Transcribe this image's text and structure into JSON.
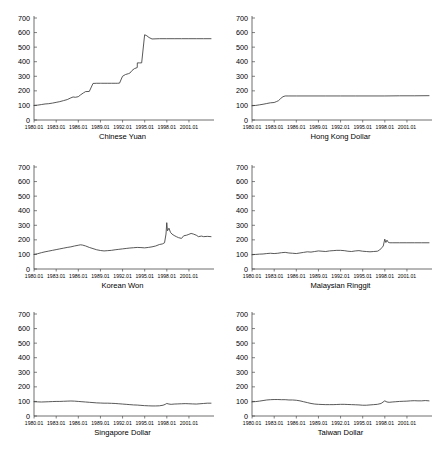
{
  "figure": {
    "panel_order": [
      "chinese_yuan",
      "hong_kong_dollar",
      "korean_won",
      "malaysian_ringgit",
      "singapore_dollar",
      "taiwan_dollar"
    ],
    "axis_color": "#4a4a4a",
    "series_color": "#3b3b3b",
    "background": "#ffffff"
  },
  "chart_data": [
    {
      "type": "line",
      "title": "Chinese Yuan",
      "xlabel": "",
      "ylabel": "",
      "ylim": [
        0,
        700
      ],
      "yticks": [
        0,
        100,
        200,
        300,
        400,
        500,
        600,
        700
      ],
      "ytick_labels": [
        "0",
        "100",
        "200",
        "300",
        "400",
        "500",
        "600",
        "700"
      ],
      "xlim": [
        1980.0,
        2004.0
      ],
      "xticks": [
        1980.01,
        1983.01,
        1986.01,
        1989.01,
        1992.01,
        1995.01,
        1998.01,
        2001.01
      ],
      "xtick_labels": [
        "1980.01",
        "1983.01",
        "1986.01",
        "1989.01",
        "1992.01",
        "1995.01",
        "1998.01",
        "2001.01"
      ],
      "grid": false,
      "legend": "none",
      "x": [
        1980.0,
        1980.5,
        1981.0,
        1981.5,
        1982.0,
        1982.5,
        1983.0,
        1983.5,
        1984.0,
        1984.5,
        1985.0,
        1985.3,
        1985.6,
        1986.0,
        1986.3,
        1986.7,
        1987.0,
        1987.5,
        1988.0,
        1988.5,
        1989.0,
        1989.2,
        1989.5,
        1990.0,
        1990.5,
        1991.0,
        1991.3,
        1991.6,
        1992.0,
        1992.4,
        1992.8,
        1993.0,
        1993.3,
        1993.6,
        1994.0,
        1994.01,
        1994.3,
        1994.6,
        1995.0,
        1995.3,
        1995.6,
        1996.0,
        1997.0,
        1998.0,
        1999.0,
        2000.0,
        2001.0,
        2002.0,
        2003.0,
        2004.0
      ],
      "y": [
        100,
        102,
        106,
        110,
        112,
        116,
        121,
        126,
        133,
        140,
        152,
        158,
        156,
        160,
        172,
        186,
        195,
        196,
        251,
        252,
        252,
        252,
        252,
        252,
        252,
        252,
        252,
        253,
        300,
        312,
        318,
        322,
        340,
        352,
        360,
        392,
        392,
        392,
        585,
        578,
        566,
        556,
        558,
        558,
        558,
        558,
        558,
        558,
        558,
        558
      ]
    },
    {
      "type": "line",
      "title": "Hong Kong Dollar",
      "xlabel": "",
      "ylabel": "",
      "ylim": [
        0,
        700
      ],
      "yticks": [
        0,
        100,
        200,
        300,
        400,
        500,
        600,
        700
      ],
      "ytick_labels": [
        "0",
        "100",
        "200",
        "300",
        "400",
        "500",
        "600",
        "700"
      ],
      "xlim": [
        1980.0,
        2004.0
      ],
      "xticks": [
        1980.01,
        1983.01,
        1986.01,
        1989.01,
        1992.01,
        1995.01,
        1998.01,
        2001.01
      ],
      "xtick_labels": [
        "1980.01",
        "1983.01",
        "1986.01",
        "1989.01",
        "1992.01",
        "1995.01",
        "1998.01",
        "2001.01"
      ],
      "grid": false,
      "legend": "none",
      "x": [
        1980.0,
        1980.5,
        1981.0,
        1981.5,
        1982.0,
        1982.5,
        1983.0,
        1983.3,
        1983.6,
        1983.9,
        1984.2,
        1984.5,
        1985.0,
        1986.0,
        1988.0,
        1990.0,
        1992.0,
        1994.0,
        1996.0,
        1998.0,
        2000.0,
        2002.0,
        2004.0
      ],
      "y": [
        98,
        100,
        104,
        108,
        113,
        118,
        120,
        126,
        133,
        148,
        160,
        165,
        165,
        165,
        165,
        165,
        165,
        165,
        165,
        165,
        166,
        166,
        167
      ]
    },
    {
      "type": "line",
      "title": "Korean Won",
      "xlabel": "",
      "ylabel": "",
      "ylim": [
        0,
        700
      ],
      "yticks": [
        0,
        100,
        200,
        300,
        400,
        500,
        600,
        700
      ],
      "ytick_labels": [
        "0",
        "100",
        "200",
        "300",
        "400",
        "500",
        "600",
        "700"
      ],
      "xlim": [
        1980.0,
        2004.0
      ],
      "xticks": [
        1980.01,
        1983.01,
        1986.01,
        1989.01,
        1992.01,
        1995.01,
        1998.01,
        2001.01
      ],
      "xtick_labels": [
        "1980.01",
        "1983.01",
        "1986.01",
        "1989.01",
        "1992.01",
        "1995.01",
        "1998.01",
        "2001.01"
      ],
      "grid": false,
      "legend": "none",
      "x": [
        1980.0,
        1980.5,
        1981.0,
        1981.5,
        1982.0,
        1982.5,
        1983.0,
        1983.5,
        1984.0,
        1984.5,
        1985.0,
        1985.5,
        1986.0,
        1986.3,
        1986.6,
        1987.0,
        1987.5,
        1988.0,
        1988.5,
        1989.0,
        1989.5,
        1990.0,
        1990.5,
        1991.0,
        1991.5,
        1992.0,
        1992.5,
        1993.0,
        1993.5,
        1994.0,
        1994.5,
        1995.0,
        1995.5,
        1996.0,
        1996.5,
        1997.0,
        1997.4,
        1997.7,
        1997.9,
        1998.0,
        1998.1,
        1998.3,
        1998.5,
        1998.7,
        1999.0,
        1999.3,
        1999.6,
        2000.0,
        2000.3,
        2000.7,
        2001.0,
        2001.3,
        2001.6,
        2002.0,
        2002.3,
        2002.7,
        2003.0,
        2003.5,
        2004.0
      ],
      "y": [
        100,
        105,
        112,
        118,
        123,
        128,
        133,
        138,
        143,
        148,
        152,
        158,
        163,
        166,
        164,
        158,
        148,
        140,
        132,
        127,
        124,
        126,
        128,
        132,
        135,
        138,
        141,
        144,
        146,
        148,
        147,
        145,
        148,
        152,
        158,
        168,
        172,
        180,
        240,
        318,
        262,
        280,
        252,
        240,
        230,
        222,
        215,
        210,
        228,
        232,
        238,
        244,
        240,
        232,
        222,
        226,
        222,
        224,
        222
      ]
    },
    {
      "type": "line",
      "title": "Malaysian Ringgit",
      "xlabel": "",
      "ylabel": "",
      "ylim": [
        0,
        700
      ],
      "yticks": [
        0,
        100,
        200,
        300,
        400,
        500,
        600,
        700
      ],
      "ytick_labels": [
        "0",
        "100",
        "200",
        "300",
        "400",
        "500",
        "600",
        "700"
      ],
      "xlim": [
        1980.0,
        2004.0
      ],
      "xticks": [
        1980.01,
        1983.01,
        1986.01,
        1989.01,
        1992.01,
        1995.01,
        1998.01,
        2001.01
      ],
      "xtick_labels": [
        "1980.01",
        "1983.01",
        "1986.01",
        "1989.01",
        "1992.01",
        "1995.01",
        "1998.01",
        "2001.01"
      ],
      "grid": false,
      "legend": "none",
      "x": [
        1980.0,
        1980.5,
        1981.0,
        1981.5,
        1982.0,
        1982.5,
        1983.0,
        1983.5,
        1984.0,
        1984.5,
        1985.0,
        1985.5,
        1986.0,
        1986.5,
        1987.0,
        1987.5,
        1988.0,
        1988.5,
        1989.0,
        1989.5,
        1990.0,
        1990.5,
        1991.0,
        1991.5,
        1992.0,
        1992.5,
        1993.0,
        1993.5,
        1994.0,
        1994.5,
        1995.0,
        1995.5,
        1996.0,
        1996.5,
        1997.0,
        1997.3,
        1997.6,
        1997.8,
        1998.0,
        1998.15,
        1998.3,
        1998.5,
        1998.7,
        1999.0,
        2000.0,
        2001.0,
        2002.0,
        2003.0,
        2004.0
      ],
      "y": [
        98,
        100,
        102,
        103,
        106,
        108,
        106,
        108,
        112,
        114,
        110,
        108,
        106,
        110,
        114,
        118,
        116,
        120,
        124,
        122,
        120,
        124,
        126,
        128,
        128,
        126,
        122,
        120,
        124,
        126,
        122,
        120,
        118,
        120,
        122,
        130,
        146,
        158,
        205,
        182,
        198,
        182,
        180,
        180,
        180,
        180,
        180,
        180,
        180
      ]
    },
    {
      "type": "line",
      "title": "Singapore Dollar",
      "xlabel": "",
      "ylabel": "",
      "ylim": [
        0,
        700
      ],
      "yticks": [
        0,
        100,
        200,
        300,
        400,
        500,
        600,
        700
      ],
      "ytick_labels": [
        "0",
        "100",
        "200",
        "300",
        "400",
        "500",
        "600",
        "700"
      ],
      "xlim": [
        1980.0,
        2004.0
      ],
      "xticks": [
        1980.01,
        1983.01,
        1986.01,
        1989.01,
        1992.01,
        1995.01,
        1998.01,
        2001.01
      ],
      "xtick_labels": [
        "1980.01",
        "1983.01",
        "1986.01",
        "1989.01",
        "1992.01",
        "1995.01",
        "1998.01",
        "2001.01"
      ],
      "grid": false,
      "legend": "none",
      "x": [
        1980.0,
        1980.5,
        1981.0,
        1981.5,
        1982.0,
        1982.5,
        1983.0,
        1983.5,
        1984.0,
        1984.5,
        1985.0,
        1985.5,
        1986.0,
        1986.5,
        1987.0,
        1987.5,
        1988.0,
        1988.5,
        1989.0,
        1989.5,
        1990.0,
        1990.5,
        1991.0,
        1991.5,
        1992.0,
        1992.5,
        1993.0,
        1993.5,
        1994.0,
        1994.5,
        1995.0,
        1995.5,
        1996.0,
        1996.5,
        1997.0,
        1997.5,
        1997.8,
        1998.0,
        1998.3,
        1998.6,
        1999.0,
        1999.5,
        2000.0,
        2000.5,
        2001.0,
        2001.5,
        2002.0,
        2002.5,
        2003.0,
        2003.5,
        2004.0
      ],
      "y": [
        98,
        97,
        96,
        97,
        98,
        99,
        100,
        100,
        101,
        102,
        103,
        102,
        100,
        98,
        96,
        94,
        92,
        90,
        89,
        88,
        88,
        87,
        86,
        84,
        82,
        80,
        78,
        76,
        75,
        73,
        71,
        70,
        69,
        69,
        70,
        74,
        80,
        86,
        82,
        80,
        82,
        83,
        84,
        85,
        84,
        83,
        82,
        84,
        86,
        88,
        88
      ]
    },
    {
      "type": "line",
      "title": "Taiwan Dollar",
      "xlabel": "",
      "ylabel": "",
      "ylim": [
        0,
        700
      ],
      "yticks": [
        0,
        100,
        200,
        300,
        400,
        500,
        600,
        700
      ],
      "ytick_labels": [
        "0",
        "100",
        "200",
        "300",
        "400",
        "500",
        "600",
        "700"
      ],
      "xlim": [
        1980.0,
        2004.0
      ],
      "xticks": [
        1980.01,
        1983.01,
        1986.01,
        1989.01,
        1992.01,
        1995.01,
        1998.01,
        2001.01
      ],
      "xtick_labels": [
        "1980.01",
        "1983.01",
        "1986.01",
        "1989.01",
        "1992.01",
        "1995.01",
        "1998.01",
        "2001.01"
      ],
      "grid": false,
      "legend": "none",
      "x": [
        1980.0,
        1980.5,
        1981.0,
        1981.5,
        1982.0,
        1982.5,
        1983.0,
        1983.5,
        1984.0,
        1984.5,
        1985.0,
        1985.5,
        1986.0,
        1986.5,
        1987.0,
        1987.5,
        1988.0,
        1988.5,
        1989.0,
        1989.5,
        1990.0,
        1990.5,
        1991.0,
        1991.5,
        1992.0,
        1992.5,
        1993.0,
        1993.5,
        1994.0,
        1994.5,
        1995.0,
        1995.5,
        1996.0,
        1996.5,
        1997.0,
        1997.5,
        1998.0,
        1998.3,
        1998.6,
        1999.0,
        1999.5,
        2000.0,
        2000.5,
        2001.0,
        2001.5,
        2002.0,
        2002.5,
        2003.0,
        2003.5,
        2004.0
      ],
      "y": [
        97,
        99,
        102,
        106,
        110,
        112,
        113,
        113,
        112,
        112,
        110,
        110,
        108,
        104,
        98,
        92,
        86,
        82,
        80,
        79,
        78,
        78,
        78,
        79,
        80,
        80,
        79,
        78,
        77,
        76,
        74,
        74,
        76,
        78,
        80,
        86,
        104,
        96,
        94,
        96,
        98,
        100,
        101,
        102,
        104,
        105,
        104,
        104,
        106,
        104
      ]
    }
  ]
}
